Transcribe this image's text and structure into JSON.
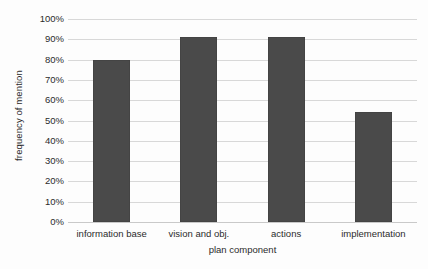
{
  "chart_data": {
    "type": "bar",
    "title": "",
    "subtitle": "",
    "xlabel": "plan component",
    "ylabel": "frequency of mention",
    "categories": [
      "information base",
      "vision and obj.",
      "actions",
      "implementation"
    ],
    "values": [
      80,
      91,
      91,
      54
    ],
    "value_labels": [
      "80%",
      "91%",
      "91%",
      "54%"
    ],
    "ylim": [
      0,
      100
    ],
    "y_ticks": [
      0,
      10,
      20,
      30,
      40,
      50,
      60,
      70,
      80,
      90,
      100
    ],
    "y_tick_labels": [
      "0%",
      "10%",
      "20%",
      "30%",
      "40%",
      "50%",
      "60%",
      "70%",
      "80%",
      "90%",
      "100%"
    ],
    "grid": "horizontal",
    "legend": "none",
    "series": [
      {
        "name": "frequency of mention",
        "values": [
          80,
          91,
          91,
          54
        ],
        "color": "#4a4a4a"
      }
    ],
    "colors": {
      "bar": "#4a4a4a",
      "gridline": "#d8d8d8",
      "baseline": "#c9c9c9",
      "background": "#fdfdfd",
      "text": "#2b2b2b"
    }
  }
}
